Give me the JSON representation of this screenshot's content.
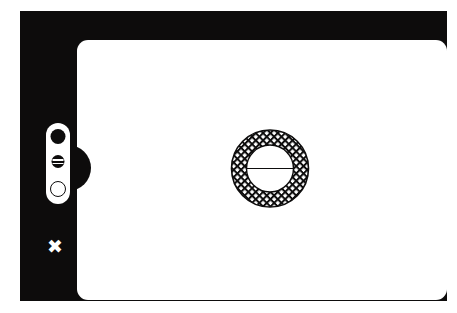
{
  "figure": {
    "background_color": "#ffffff",
    "ink_color": "#0d0c0c",
    "paper_color": "#ffffff"
  },
  "bezel": {
    "name": "outer-frame",
    "fill": "#0d0c0c"
  },
  "page": {
    "name": "inner-panel",
    "fill": "#ffffff",
    "corner_radius": "11"
  },
  "control_pill": {
    "name": "side-control-pill",
    "fill": "#ffffff",
    "indicators": [
      {
        "id": "indicator-filled",
        "state": "filled",
        "glyph": "solid-disc-icon"
      },
      {
        "id": "indicator-striped",
        "state": "striped",
        "glyph": "striped-disc-icon",
        "stripes": 2
      },
      {
        "id": "indicator-hollow",
        "state": "hollow",
        "glyph": "ring-icon"
      }
    ]
  },
  "x_mark": {
    "name": "close-mark",
    "symbol": "✖",
    "color": "#ffffff"
  },
  "annulus": {
    "name": "cross-hatched-annulus",
    "outer_radius": 39,
    "inner_radius": 24,
    "center_x": 40,
    "center_y": 40,
    "hatch": "diagonal-cross-hatch",
    "hatch_spacing": 5.2,
    "hatch_angle_deg": 45,
    "stroke": "#0d0c0c",
    "inner_fill": "#ffffff",
    "diameter_line": {
      "name": "center-diameter-line",
      "orientation": "horizontal",
      "stroke": "#0d0c0c"
    }
  }
}
